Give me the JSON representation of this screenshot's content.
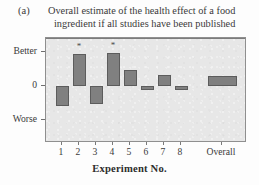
{
  "figure": {
    "panel_label": "(a)",
    "caption_line1": "Overall estimate of the health effect of a food",
    "caption_line2": "ingredient if all studies have been published",
    "colors": {
      "bar_fill": "#808080",
      "bar_edge": "#5c5c5c",
      "plot_background": "#e7e7e7",
      "frame": "#8f8f8f",
      "zero_line": "#7c7c7c",
      "text": "#3a3a3a"
    }
  },
  "chart_data": {
    "type": "bar",
    "title": "Overall estimate of the health effect of a food ingredient if all studies have been published",
    "xlabel": "Experiment No.",
    "ylabel": "",
    "categories": [
      "1",
      "2",
      "3",
      "4",
      "5",
      "6",
      "7",
      "8",
      "Overall"
    ],
    "values": [
      -0.45,
      0.72,
      -0.4,
      0.75,
      0.36,
      -0.09,
      0.26,
      -0.08,
      0.22
    ],
    "significance_markers": [
      "",
      "*",
      "",
      "*",
      "",
      "",
      "",
      "",
      ""
    ],
    "ylim": [
      -1.0,
      1.0
    ],
    "y_tick_positions": [
      0.78,
      0,
      -0.78
    ],
    "y_tick_labels": [
      "Better",
      "0",
      "Worse"
    ],
    "grid": false,
    "legend": "none"
  },
  "axes": {
    "y_labels": [
      {
        "text": "Better",
        "value": 0.78
      },
      {
        "text": "0",
        "value": 0
      },
      {
        "text": "Worse",
        "value": -0.78
      }
    ],
    "x_labels": [
      "1",
      "2",
      "3",
      "4",
      "5",
      "6",
      "7",
      "8",
      "Overall"
    ],
    "x_title": "Experiment No."
  }
}
